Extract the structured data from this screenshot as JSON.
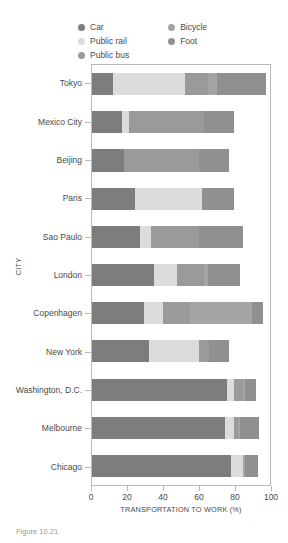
{
  "legend": {
    "items": [
      {
        "label": "Car",
        "color": "#7d7d7d",
        "icon": "legend-dot-icon"
      },
      {
        "label": "Public rail",
        "color": "#dcdcdc",
        "icon": "legend-dot-icon"
      },
      {
        "label": "Public bus",
        "color": "#9a9a9a",
        "icon": "legend-dot-icon"
      },
      {
        "label": "Bicycle",
        "color": "#a5a5a5",
        "icon": "legend-dot-icon"
      },
      {
        "label": "Foot",
        "color": "#909090",
        "icon": "legend-dot-icon"
      }
    ]
  },
  "axes": {
    "xlabel": "TRANSPORTATION TO WORK (%)",
    "ylabel": "CITY",
    "xticks": [
      0,
      20,
      40,
      60,
      80,
      100
    ],
    "xlim": [
      0,
      100
    ]
  },
  "caption": "Figure 10.21",
  "chart_data": {
    "type": "bar",
    "orientation": "horizontal",
    "stacked": true,
    "title": "",
    "xlabel": "TRANSPORTATION TO WORK (%)",
    "ylabel": "CITY",
    "xlim": [
      0,
      100
    ],
    "grid": false,
    "legend_position": "top",
    "categories": [
      "Tokyo",
      "Mexico City",
      "Beijing",
      "Paris",
      "Sao Paulo",
      "London",
      "Copenhagen",
      "New York",
      "Washington, D.C.",
      "Melbourne",
      "Chicago"
    ],
    "series": [
      {
        "name": "Car",
        "color": "#7d7d7d",
        "values": [
          12,
          17,
          18,
          24,
          27,
          35,
          29,
          32,
          76,
          75,
          78
        ]
      },
      {
        "name": "Public rail",
        "color": "#dcdcdc",
        "values": [
          40,
          4,
          0,
          38,
          6,
          13,
          11,
          28,
          4,
          5,
          7
        ]
      },
      {
        "name": "Public bus",
        "color": "#9a9a9a",
        "values": [
          13,
          42,
          42,
          0,
          27,
          15,
          15,
          6,
          5,
          2,
          0
        ]
      },
      {
        "name": "Bicycle",
        "color": "#a5a5a5",
        "values": [
          5,
          0,
          0,
          0,
          0,
          2,
          35,
          0,
          1,
          1,
          1
        ]
      },
      {
        "name": "Foot",
        "color": "#909090",
        "values": [
          28,
          17,
          17,
          18,
          25,
          18,
          6,
          11,
          6,
          11,
          7
        ]
      }
    ],
    "totals": [
      98,
      80,
      77,
      80,
      85,
      83,
      96,
      77,
      92,
      94,
      93
    ]
  }
}
